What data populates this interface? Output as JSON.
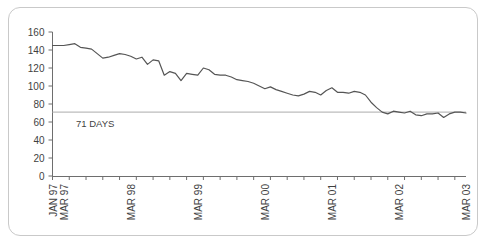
{
  "chart_data": {
    "type": "line",
    "title": "",
    "subtitle": "",
    "xlabel": "",
    "ylabel": "",
    "ylim": [
      0,
      160
    ],
    "y_ticks": [
      0,
      20,
      40,
      60,
      80,
      100,
      120,
      140,
      160
    ],
    "grid": false,
    "legend": "none",
    "x_tick_labels": [
      "JAN 97",
      "MAR 97",
      "MAR 98",
      "MAR 99",
      "MAR 00",
      "MAR 01",
      "MAR 02",
      "MAR 03"
    ],
    "x_tick_label_positions": [
      0,
      2,
      14,
      26,
      38,
      50,
      62,
      74
    ],
    "x_minor_tick_interval_months": 3,
    "x_range_months": [
      0,
      74
    ],
    "annotations": [
      {
        "label": "71 DAYS",
        "value": 71,
        "type": "horizontal-reference-line"
      }
    ],
    "series": [
      {
        "name": "Days",
        "units": "days",
        "x": [
          "JAN 97",
          "FEB 97",
          "MAR 97",
          "APR 97",
          "MAY 97",
          "JUN 97",
          "JUL 97",
          "AUG 97",
          "SEP 97",
          "OCT 97",
          "NOV 97",
          "DEC 97",
          "JAN 98",
          "FEB 98",
          "MAR 98",
          "APR 98",
          "MAY 98",
          "JUN 98",
          "JUL 98",
          "AUG 98",
          "SEP 98",
          "OCT 98",
          "NOV 98",
          "DEC 98",
          "JAN 99",
          "FEB 99",
          "MAR 99",
          "APR 99",
          "MAY 99",
          "JUN 99",
          "JUL 99",
          "AUG 99",
          "SEP 99",
          "OCT 99",
          "NOV 99",
          "DEC 99",
          "JAN 00",
          "FEB 00",
          "MAR 00",
          "APR 00",
          "MAY 00",
          "JUN 00",
          "JUL 00",
          "AUG 00",
          "SEP 00",
          "OCT 00",
          "NOV 00",
          "DEC 00",
          "JAN 01",
          "FEB 01",
          "MAR 01",
          "APR 01",
          "MAY 01",
          "JUN 01",
          "JUL 01",
          "AUG 01",
          "SEP 01",
          "OCT 01",
          "NOV 01",
          "DEC 01",
          "JAN 02",
          "FEB 02",
          "MAR 02",
          "APR 02",
          "MAY 02",
          "JUN 02",
          "JUL 02",
          "AUG 02",
          "SEP 02",
          "OCT 02",
          "NOV 02",
          "DEC 02",
          "JAN 03",
          "FEB 03",
          "MAR 03"
        ],
        "values": [
          145,
          145,
          145,
          146,
          147,
          143,
          142,
          141,
          136,
          131,
          132,
          134,
          136,
          135,
          133,
          130,
          132,
          124,
          129,
          128,
          112,
          116,
          114,
          106,
          114,
          113,
          112,
          120,
          118,
          113,
          112,
          112,
          110,
          107,
          106,
          105,
          103,
          100,
          97,
          99,
          96,
          94,
          92,
          90,
          89,
          91,
          94,
          93,
          90,
          95,
          98,
          93,
          93,
          92,
          94,
          93,
          90,
          82,
          76,
          71,
          69,
          72,
          71,
          70,
          72,
          68,
          67,
          69,
          69,
          70,
          65,
          69,
          71,
          71,
          70
        ]
      }
    ]
  }
}
